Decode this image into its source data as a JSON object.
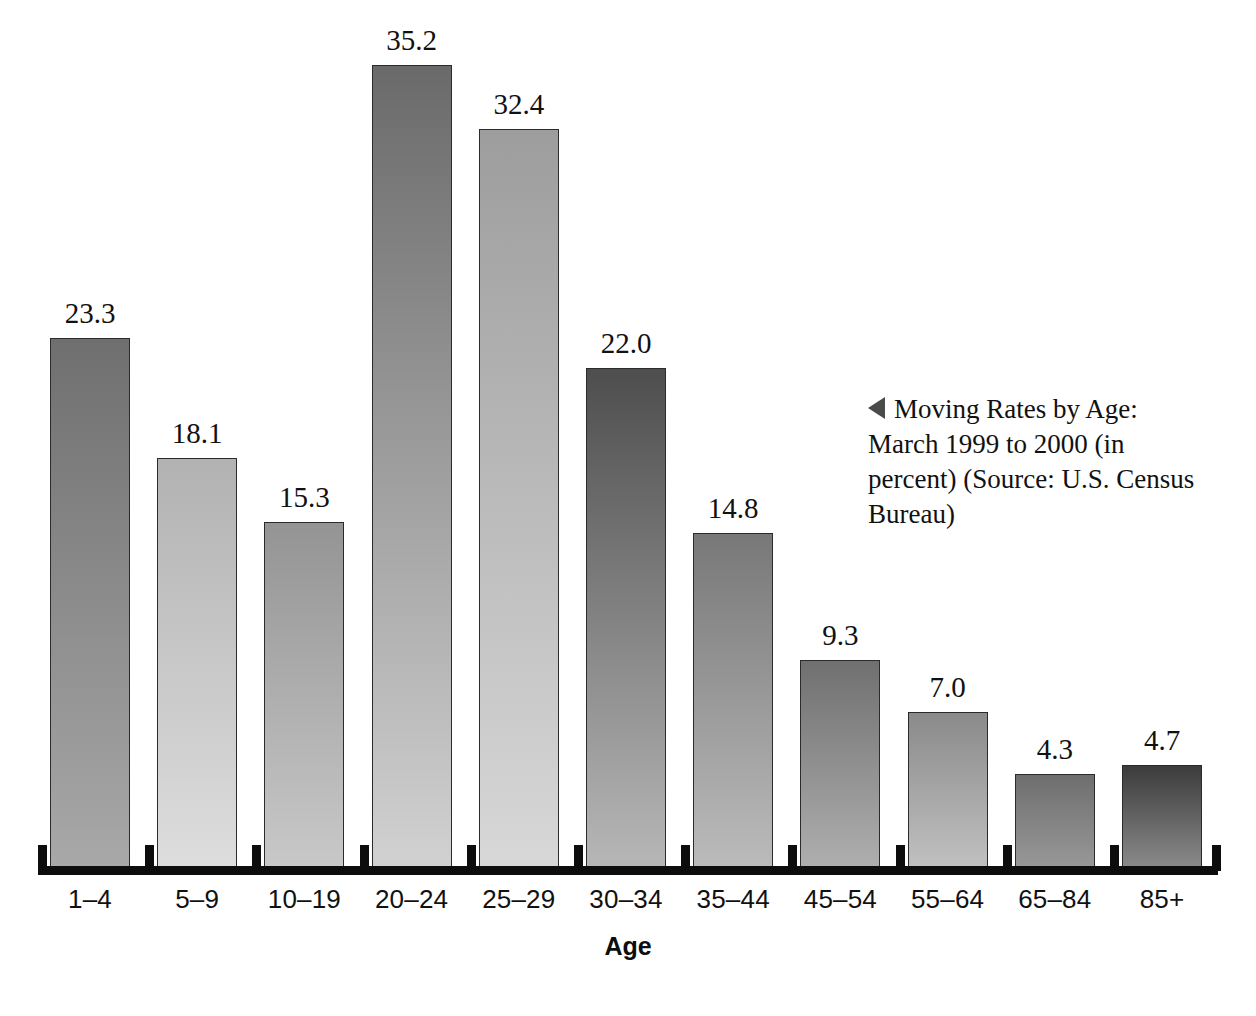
{
  "chart_data": {
    "type": "bar",
    "title": "Moving Rates by Age: March 1999 to 2000 (in percent)",
    "xlabel": "Age",
    "ylabel": "",
    "ylim": [
      0,
      35.2
    ],
    "grid": false,
    "legend": "none",
    "source": "U.S. Census Bureau",
    "categories": [
      "1–4",
      "5–9",
      "10–19",
      "20–24",
      "25–29",
      "30–34",
      "35–44",
      "45–54",
      "55–64",
      "65–84",
      "85+"
    ],
    "values": [
      23.3,
      18.1,
      15.3,
      35.2,
      32.4,
      22.0,
      14.8,
      9.3,
      7.0,
      4.3,
      4.7
    ],
    "value_labels": [
      "23.3",
      "18.1",
      "15.3",
      "35.2",
      "32.4",
      "22.0",
      "14.8",
      "9.3",
      "7.0",
      "4.3",
      "4.7"
    ],
    "bar_colors_top": [
      "#6f6f6f",
      "#b2b2b2",
      "#949494",
      "#6a6a6a",
      "#9d9d9d",
      "#4e4e4e",
      "#787878",
      "#707070",
      "#8a8a8a",
      "#6e6e6e",
      "#3b3b3b"
    ],
    "bar_colors_bottom": [
      "#a9a9a9",
      "#dedede",
      "#c9c9c9",
      "#d2d2d2",
      "#d8d8d8",
      "#b8b8b8",
      "#bcbcbc",
      "#b0b0b0",
      "#c2c2c2",
      "#9a9a9a",
      "#8e8e8e"
    ],
    "bar_border_color": "#2b2b2b",
    "axis_color": "#0d0d0d"
  },
  "caption": {
    "marker": "left-triangle-marker",
    "line1": "Moving Rates by Age: March",
    "line2": "1999 to 2000 (in percent)",
    "line3": "(Source: U.S. Census Bureau)"
  },
  "axis": {
    "title": "Age"
  }
}
